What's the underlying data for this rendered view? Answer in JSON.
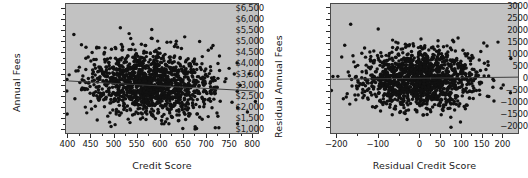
{
  "figure": {
    "background_color": "#ffffff",
    "plot_background_color": "#c2c2c2",
    "point_color": "#111111",
    "line_color": "#3c3c3c",
    "panel_count": 2
  },
  "chart_data": [
    {
      "type": "scatter",
      "panel": "left",
      "title": "",
      "xlabel": "Credit Score",
      "ylabel": "Annual Fees",
      "xlim": [
        395,
        815
      ],
      "ylim": [
        780,
        6750
      ],
      "xticks": [
        400,
        450,
        500,
        550,
        600,
        650,
        700,
        750,
        800
      ],
      "xticklabels": [
        "400",
        "450",
        "500",
        "550",
        "600",
        "650",
        "700",
        "750",
        "800"
      ],
      "yticks": [
        1000,
        1500,
        2000,
        2500,
        3000,
        3500,
        4000,
        4500,
        5000,
        5500,
        6000,
        6500
      ],
      "yticklabels": [
        "$1,000",
        "$1,500",
        "$2,000",
        "$2,500",
        "$3,000",
        "$3,500",
        "$4,000",
        "$4,500",
        "$5,000",
        "$5,500",
        "$6,000",
        "$6,500"
      ],
      "grid": false,
      "legend": "none",
      "n_points": 1400,
      "cloud": {
        "x_mean": 580,
        "x_sd": 72,
        "y_mean": 3050,
        "y_sd": 760,
        "correlation": -0.06
      },
      "fit_line": {
        "label": "least-squares fit",
        "x_start": 400,
        "y_start": 3190,
        "x_end": 810,
        "y_end": 2720
      }
    },
    {
      "type": "scatter",
      "panel": "right",
      "title": "",
      "xlabel": "Residual Credit Score",
      "ylabel": "Residual Annual Fees",
      "xlim": [
        -215,
        240
      ],
      "ylim": [
        -2300,
        3150
      ],
      "xticks": [
        -200,
        -100,
        0,
        50,
        100,
        150,
        200
      ],
      "xticklabels": [
        "−200",
        "−100",
        "0",
        "50",
        "100",
        "150",
        "200"
      ],
      "yticks": [
        -2000,
        -1500,
        -1000,
        -500,
        0,
        500,
        1000,
        1500,
        2000,
        2500,
        3000
      ],
      "yticklabels": [
        "−2000",
        "−1500",
        "−1000",
        "−500",
        "0",
        "500",
        "1000",
        "1500",
        "2000",
        "2500",
        "3000"
      ],
      "grid": false,
      "legend": "none",
      "n_points": 1400,
      "cloud": {
        "x_mean": 0,
        "x_sd": 72,
        "y_mean": 0,
        "y_sd": 620,
        "correlation": 0.0
      },
      "fit_line": {
        "label": "zero reference line",
        "x_start": -215,
        "y_start": -30,
        "x_end": 240,
        "y_end": 60
      }
    }
  ]
}
